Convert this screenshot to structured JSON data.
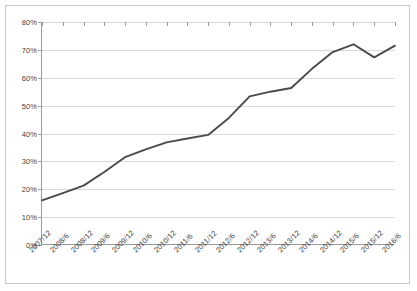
{
  "chart_data": {
    "type": "line",
    "title": "",
    "subtitle": "",
    "xlabel": "",
    "ylabel": "",
    "ylim": [
      0,
      80
    ],
    "ytick_labels": [
      "0%",
      "10%",
      "20%",
      "30%",
      "40%",
      "50%",
      "60%",
      "70%",
      "80%"
    ],
    "ytick_values": [
      0,
      10,
      20,
      30,
      40,
      50,
      60,
      70,
      80
    ],
    "ytick_suffix": "%",
    "grid": true,
    "legend": "none",
    "legend_position": "none",
    "line_color": "#4a4a4a",
    "grid_color": "#d9d9d9",
    "axis_color": "#9a9a9a",
    "border_color": "#c8c8c8",
    "background_color": "#ffffff",
    "markers": false,
    "categories": [
      "2007/12",
      "2008/6",
      "2008/12",
      "2009/6",
      "2009/12",
      "2010/6",
      "2010/12",
      "2011/6",
      "2011/12",
      "2012/6",
      "2012/12",
      "2013/6",
      "2013/12",
      "2014/6",
      "2014/12",
      "2015/6",
      "2015/12",
      "2016/6"
    ],
    "values": [
      16.0,
      18.6,
      21.3,
      26.2,
      31.5,
      34.3,
      36.8,
      38.2,
      39.5,
      45.6,
      53.3,
      55.0,
      56.3,
      63.2,
      69.2,
      72.0,
      67.3,
      71.5
    ],
    "series": [
      {
        "name": "series-1",
        "values": [
          16.0,
          18.6,
          21.3,
          26.2,
          31.5,
          34.3,
          36.8,
          38.2,
          39.5,
          45.6,
          53.3,
          55.0,
          56.3,
          63.2,
          69.2,
          72.0,
          67.3,
          71.5
        ]
      }
    ],
    "annotations": []
  }
}
